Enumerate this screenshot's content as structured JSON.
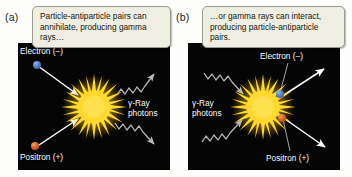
{
  "figure": {
    "background_color": "#ffffff",
    "stage_color": "#050505",
    "callout_color": "#efeee2",
    "electron_color": "#4f7fc4",
    "positron_color": "#d9602a",
    "burst_color": "#ffd92e",
    "photon_color": "#b9b9b9",
    "particle_arrow_color": "#ffffff"
  },
  "panels": [
    {
      "letter": "(a)",
      "caption": "Particle-antiparticle pairs can annihilate, producing gamma rays…",
      "process": "annihilation",
      "labels": {
        "electron": "Electron (−)",
        "positron": "Positron (+)",
        "photons_line1": "γ-Ray",
        "photons_line2": "photons"
      },
      "inputs": [
        "Electron (−)",
        "Positron (+)"
      ],
      "outputs": [
        "γ-Ray photons",
        "γ-Ray photons"
      ]
    },
    {
      "letter": "(b)",
      "caption": "…or gamma rays can interact, producing particle-antiparticle pairs.",
      "process": "pair-production",
      "labels": {
        "electron": "Electron (−)",
        "positron": "Positron (+)",
        "photons_line1": "γ-Ray",
        "photons_line2": "photons"
      },
      "inputs": [
        "γ-Ray photons",
        "γ-Ray photons"
      ],
      "outputs": [
        "Electron (−)",
        "Positron (+)"
      ]
    }
  ]
}
